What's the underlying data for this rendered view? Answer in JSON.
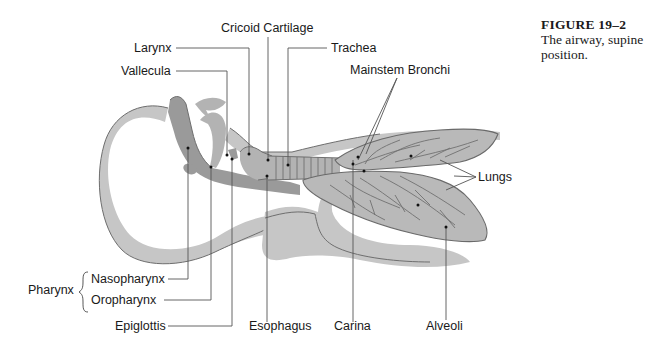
{
  "caption": {
    "figure_number": "FIGURE 19–2",
    "text": "The airway, supine position."
  },
  "labels": {
    "cricoid_cartilage": "Cricoid Cartilage",
    "larynx": "Larynx",
    "trachea": "Trachea",
    "vallecula": "Vallecula",
    "mainstem_bronchi": "Mainstem Bronchi",
    "lungs": "Lungs",
    "pharynx": "Pharynx",
    "nasopharynx": "Nasopharynx",
    "oropharynx": "Oropharynx",
    "epiglottis": "Epiglottis",
    "esophagus": "Esophagus",
    "carina": "Carina",
    "alveoli": "Alveoli"
  },
  "colors": {
    "body": "#c6c6c6",
    "airway": "#9a9a9a",
    "lung": "#b9b9b9",
    "leader": "#555555",
    "text": "#1a1a1a"
  }
}
